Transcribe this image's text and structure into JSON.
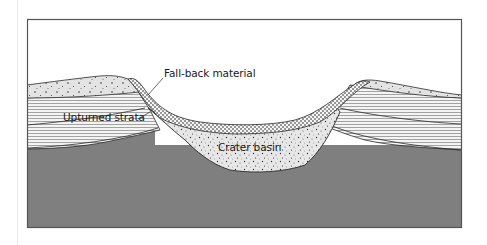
{
  "figure": {
    "labels": {
      "fallback": "Fall-back material",
      "strata": "Upturned strata",
      "basin": "Crater basin"
    },
    "layers": [
      {
        "name": "surface-regolith",
        "pattern": "sparse dots",
        "color": "#e4e4e4"
      },
      {
        "name": "upturned-strata",
        "pattern": "horizontal hatching",
        "color": "#f2f2f2"
      },
      {
        "name": "fall-back-material",
        "pattern": "dense dots",
        "color": "#f4f4f4"
      },
      {
        "name": "crater-basin-breccia",
        "pattern": "speckled",
        "color": "#e6e6e6"
      },
      {
        "name": "bedrock",
        "pattern": "solid",
        "color": "#7f7f7f"
      }
    ],
    "colors": {
      "frame": "#555555",
      "outline": "#2a2a2a",
      "bedrock": "#7f7f7f",
      "sky": "#ffffff"
    }
  }
}
